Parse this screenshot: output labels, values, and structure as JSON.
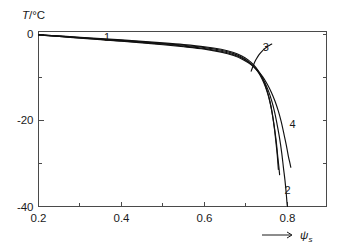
{
  "chart_data": {
    "type": "line",
    "title": "",
    "subtitle": "",
    "xlabel": "ψ",
    "xlabel_sub": "s",
    "xlabel_arrow": "→",
    "ylabel": "T",
    "ylabel_unit": "/°C",
    "xlim": [
      0.2,
      0.894
    ],
    "ylim": [
      -40,
      2
    ],
    "grid": false,
    "legend_position": "inline-curve-labels",
    "xticks": [
      0.2,
      0.4,
      0.6,
      0.8
    ],
    "xticklabels": [
      "0.2",
      "0.4",
      "0.6",
      "0.8"
    ],
    "xminorticks": [
      0.3,
      0.5,
      0.7
    ],
    "yticks": [
      0,
      -20,
      -40
    ],
    "yticklabels": [
      "0",
      "-20",
      "-40"
    ],
    "yminorticks": [
      -10,
      -30
    ],
    "series": [
      {
        "name": "1",
        "label": "1",
        "label_x": 0.365,
        "label_y": -0.6,
        "points": [
          [
            0.2,
            -0.15
          ],
          [
            0.25,
            -0.45
          ],
          [
            0.3,
            -0.75
          ],
          [
            0.35,
            -1.05
          ],
          [
            0.4,
            -1.35
          ],
          [
            0.45,
            -1.7
          ],
          [
            0.5,
            -2.05
          ],
          [
            0.55,
            -2.45
          ],
          [
            0.6,
            -2.95
          ],
          [
            0.64,
            -3.55
          ],
          [
            0.67,
            -4.3
          ],
          [
            0.69,
            -5.1
          ],
          [
            0.705,
            -6.0
          ],
          [
            0.718,
            -7.1
          ],
          [
            0.728,
            -8.3
          ],
          [
            0.737,
            -9.7
          ],
          [
            0.744,
            -11.2
          ],
          [
            0.75,
            -12.9
          ],
          [
            0.756,
            -14.9
          ],
          [
            0.761,
            -17.2
          ],
          [
            0.765,
            -19.6
          ],
          [
            0.769,
            -22.3
          ],
          [
            0.772,
            -25.0
          ],
          [
            0.775,
            -27.7
          ],
          [
            0.777,
            -30.2
          ],
          [
            0.778,
            -31.4
          ]
        ]
      },
      {
        "name": "2",
        "label": "2",
        "label_x": 0.8,
        "label_y": -36.2,
        "points": [
          [
            0.2,
            -0.2
          ],
          [
            0.25,
            -0.55
          ],
          [
            0.3,
            -0.9
          ],
          [
            0.35,
            -1.25
          ],
          [
            0.4,
            -1.6
          ],
          [
            0.45,
            -1.95
          ],
          [
            0.5,
            -2.35
          ],
          [
            0.55,
            -2.8
          ],
          [
            0.6,
            -3.35
          ],
          [
            0.64,
            -4.0
          ],
          [
            0.67,
            -4.8
          ],
          [
            0.692,
            -5.7
          ],
          [
            0.71,
            -6.8
          ],
          [
            0.723,
            -8.0
          ],
          [
            0.735,
            -9.5
          ],
          [
            0.745,
            -11.2
          ],
          [
            0.754,
            -13.2
          ],
          [
            0.762,
            -15.5
          ],
          [
            0.769,
            -18.1
          ],
          [
            0.775,
            -21.0
          ],
          [
            0.781,
            -24.2
          ],
          [
            0.786,
            -27.5
          ],
          [
            0.79,
            -30.8
          ],
          [
            0.794,
            -34.0
          ],
          [
            0.797,
            -37.0
          ],
          [
            0.799,
            -39.4
          ],
          [
            0.8,
            -40.0
          ]
        ]
      },
      {
        "name": "3",
        "label": "3",
        "label_x": 0.748,
        "label_y": -3.1,
        "points": [
          [
            0.2,
            -0.18
          ],
          [
            0.25,
            -0.5
          ],
          [
            0.3,
            -0.82
          ],
          [
            0.35,
            -1.15
          ],
          [
            0.4,
            -1.48
          ],
          [
            0.45,
            -1.82
          ],
          [
            0.5,
            -2.2
          ],
          [
            0.55,
            -2.62
          ],
          [
            0.6,
            -3.15
          ],
          [
            0.64,
            -3.78
          ],
          [
            0.67,
            -4.55
          ],
          [
            0.69,
            -5.4
          ],
          [
            0.706,
            -6.4
          ],
          [
            0.719,
            -7.55
          ],
          [
            0.73,
            -8.9
          ],
          [
            0.739,
            -10.5
          ],
          [
            0.747,
            -12.3
          ],
          [
            0.754,
            -14.4
          ],
          [
            0.76,
            -16.8
          ],
          [
            0.765,
            -19.4
          ],
          [
            0.769,
            -22.1
          ],
          [
            0.773,
            -25.0
          ],
          [
            0.776,
            -27.9
          ],
          [
            0.779,
            -30.6
          ],
          [
            0.781,
            -32.6
          ]
        ]
      },
      {
        "name": "3-branch",
        "label": "",
        "label_x": null,
        "label_y": null,
        "points": [
          [
            0.7125,
            -8.6
          ],
          [
            0.716,
            -7.7
          ],
          [
            0.7195,
            -6.85
          ],
          [
            0.7235,
            -6.05
          ],
          [
            0.728,
            -5.3
          ],
          [
            0.733,
            -4.6
          ],
          [
            0.739,
            -3.95
          ],
          [
            0.745,
            -3.4
          ],
          [
            0.751,
            -2.95
          ],
          [
            0.757,
            -2.6
          ],
          [
            0.762,
            -2.35
          ]
        ]
      },
      {
        "name": "4",
        "label": "4",
        "label_x": 0.812,
        "label_y": -20.8,
        "points": [
          [
            0.2,
            -0.22
          ],
          [
            0.25,
            -0.58
          ],
          [
            0.3,
            -0.95
          ],
          [
            0.35,
            -1.3
          ],
          [
            0.4,
            -1.68
          ],
          [
            0.45,
            -2.05
          ],
          [
            0.5,
            -2.48
          ],
          [
            0.55,
            -2.95
          ],
          [
            0.6,
            -3.5
          ],
          [
            0.64,
            -4.2
          ],
          [
            0.67,
            -5.0
          ],
          [
            0.693,
            -5.95
          ],
          [
            0.712,
            -7.1
          ],
          [
            0.727,
            -8.4
          ],
          [
            0.74,
            -9.9
          ],
          [
            0.751,
            -11.6
          ],
          [
            0.761,
            -13.5
          ],
          [
            0.77,
            -15.6
          ],
          [
            0.778,
            -17.9
          ],
          [
            0.785,
            -20.4
          ],
          [
            0.791,
            -23.0
          ],
          [
            0.797,
            -25.7
          ],
          [
            0.802,
            -28.3
          ],
          [
            0.806,
            -30.0
          ],
          [
            0.808,
            -30.9
          ]
        ]
      }
    ]
  }
}
